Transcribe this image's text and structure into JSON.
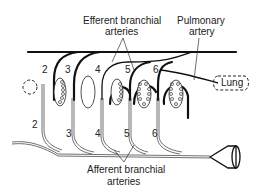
{
  "labels": {
    "efferent_line1": "Efferent branchial",
    "efferent_line2": "arteries",
    "pulmonary_line1": "Pulmonary",
    "pulmonary_line2": "artery",
    "lung": "Lung",
    "afferent_line1": "Afferent branchial",
    "afferent_line2": "arteries"
  },
  "arch_numbers_top": [
    "2",
    "3",
    "4",
    "5",
    "6"
  ],
  "arch_numbers_bottom": [
    "2",
    "3",
    "4",
    "5",
    "6"
  ],
  "colors": {
    "line": "#111111",
    "text": "#222222",
    "background": "#ffffff"
  }
}
